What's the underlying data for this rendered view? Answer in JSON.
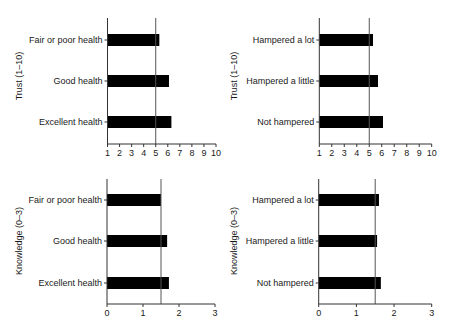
{
  "chart_data": [
    {
      "type": "bar",
      "orientation": "horizontal",
      "panel": "top-left",
      "ylabel": "Trust (1–10)",
      "xlabel": "",
      "categories": [
        "Fair or poor health",
        "Good health",
        "Excellent health"
      ],
      "values": [
        5.3,
        6.1,
        6.3
      ],
      "xlim": [
        1,
        10
      ],
      "xticks": [
        1,
        2,
        3,
        4,
        5,
        6,
        7,
        8,
        9,
        10
      ],
      "reference_line": 5,
      "grid": false
    },
    {
      "type": "bar",
      "orientation": "horizontal",
      "panel": "top-right",
      "ylabel": "Trust (1–10)",
      "xlabel": "",
      "categories": [
        "Hampered a lot",
        "Hampered a little",
        "Not hampered"
      ],
      "values": [
        5.3,
        5.7,
        6.1
      ],
      "xlim": [
        1,
        10
      ],
      "xticks": [
        1,
        2,
        3,
        4,
        5,
        6,
        7,
        8,
        9,
        10
      ],
      "reference_line": 5,
      "grid": false
    },
    {
      "type": "bar",
      "orientation": "horizontal",
      "panel": "bottom-left",
      "ylabel": "Knowledge (0–3)",
      "xlabel": "",
      "categories": [
        "Fair or poor health",
        "Good health",
        "Excellent health"
      ],
      "values": [
        1.5,
        1.67,
        1.72
      ],
      "xlim": [
        0,
        3
      ],
      "xticks": [
        0,
        1,
        2,
        3
      ],
      "reference_line": 1.5,
      "grid": false
    },
    {
      "type": "bar",
      "orientation": "horizontal",
      "panel": "bottom-right",
      "ylabel": "Knowledge (0–3)",
      "xlabel": "",
      "categories": [
        "Hampered a lot",
        "Hampered a little",
        "Not hampered"
      ],
      "values": [
        1.6,
        1.55,
        1.65
      ],
      "xlim": [
        0,
        3
      ],
      "xticks": [
        0,
        1,
        2,
        3
      ],
      "reference_line": 1.5,
      "grid": false
    }
  ],
  "colors": {
    "bar": "#000000",
    "axis": "#333333",
    "reference_line": "#555555"
  }
}
